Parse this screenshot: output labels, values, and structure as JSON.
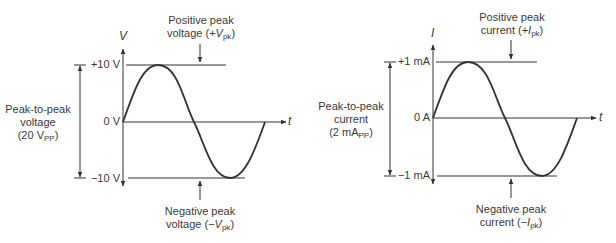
{
  "voltage_diagram": {
    "axis_y_label": "V",
    "axis_x_label": "t",
    "tick_pos": "+10 V",
    "tick_zero": "0 V",
    "tick_neg": "−10 V",
    "pp_label_line1": "Peak-to-peak",
    "pp_label_line2": "voltage",
    "pp_label_line3_pre": "(20 V",
    "pp_label_line3_sub": "PP",
    "pp_label_line3_post": ")",
    "pos_peak_line1": "Positive peak",
    "pos_peak_line2_pre": "voltage (+",
    "pos_peak_line2_var": "V",
    "pos_peak_line2_sub": "pk",
    "pos_peak_line2_post": ")",
    "neg_peak_line1": "Negative peak",
    "neg_peak_line2_pre": "voltage (−",
    "neg_peak_line2_var": "V",
    "neg_peak_line2_sub": "pk",
    "neg_peak_line2_post": ")"
  },
  "current_diagram": {
    "axis_y_label": "I",
    "axis_x_label": "t",
    "tick_pos": "+1 mA",
    "tick_zero": "0 A",
    "tick_neg": "−1 mA",
    "pp_label_line1": "Peak-to-peak",
    "pp_label_line2": "current",
    "pp_label_line3_pre": "(2 mA",
    "pp_label_line3_sub": "PP",
    "pp_label_line3_post": ")",
    "pos_peak_line1": "Positive peak",
    "pos_peak_line2_pre": "current (+",
    "pos_peak_line2_var": "I",
    "pos_peak_line2_sub": "pk",
    "pos_peak_line2_post": ")",
    "neg_peak_line1": "Negative peak",
    "neg_peak_line2_pre": "current (−",
    "neg_peak_line2_var": "I",
    "neg_peak_line2_sub": "pk",
    "neg_peak_line2_post": ")"
  },
  "colors": {
    "line": "#333333",
    "text": "#3a3a3a",
    "background": "#ffffff"
  }
}
